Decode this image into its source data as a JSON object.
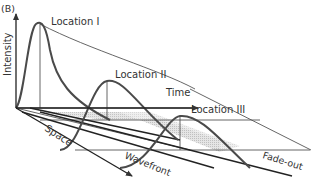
{
  "panel_label": "(B)",
  "axes": {
    "intensity": "Intensity",
    "time": "Time",
    "space": "Space"
  },
  "locations": [
    {
      "label": "Location I"
    },
    {
      "label": "Location II"
    },
    {
      "label": "Location III"
    }
  ],
  "annotations": {
    "wavefront": "Wavefront",
    "fadeout": "Fade-out"
  },
  "colors": {
    "curve": "#4a4a4a",
    "axis": "#222222",
    "thin": "#555555",
    "shade": "#d6d6d6"
  }
}
